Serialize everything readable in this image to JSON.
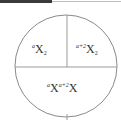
{
  "diagram": {
    "type": "circle-quadrants",
    "colors": {
      "stroke": "#8a8a8a",
      "text": "#333333",
      "top_bar": "#3a3a3a"
    },
    "cells": [
      {
        "position": "top-left",
        "prefix_sup": "a",
        "base": "X",
        "sub": "2"
      },
      {
        "position": "top-right",
        "prefix_sup": "a+2",
        "base": "X",
        "sub": "2"
      },
      {
        "position": "bottom",
        "prefix_sup": "a",
        "base": "X",
        "mid_sup": "a+2",
        "base2": "X"
      }
    ]
  }
}
